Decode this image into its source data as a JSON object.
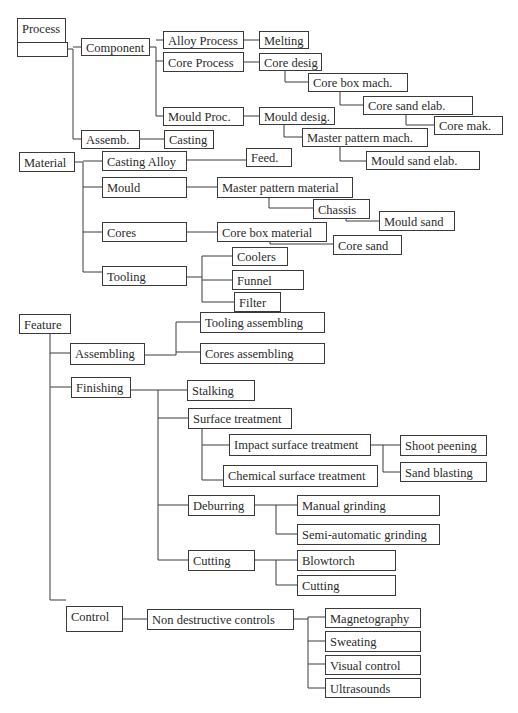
{
  "colors": {
    "line": "#3a3a3a",
    "text": "#2a2a2a",
    "background": "#ffffff"
  },
  "nodes": [
    {
      "id": "process",
      "label": "Process",
      "x": 17,
      "y": 18,
      "w": 48,
      "h": 24
    },
    {
      "id": "process_under",
      "label": "",
      "x": 17,
      "y": 42,
      "w": 50,
      "h": 14
    },
    {
      "id": "component",
      "label": "Component",
      "x": 81,
      "y": 38,
      "w": 68,
      "h": 17
    },
    {
      "id": "alloy_process",
      "label": "Alloy Process",
      "x": 163,
      "y": 31,
      "w": 80,
      "h": 17
    },
    {
      "id": "melting",
      "label": "Melting",
      "x": 259,
      "y": 31,
      "w": 49,
      "h": 17
    },
    {
      "id": "core_process",
      "label": "Core Process",
      "x": 163,
      "y": 52,
      "w": 80,
      "h": 19
    },
    {
      "id": "core_desig",
      "label": "Core desig",
      "x": 259,
      "y": 53,
      "w": 62,
      "h": 17
    },
    {
      "id": "core_box_mach",
      "label": "Core box mach.",
      "x": 308,
      "y": 73,
      "w": 99,
      "h": 18
    },
    {
      "id": "core_sand_elab",
      "label": "Core sand elab.",
      "x": 363,
      "y": 96,
      "w": 109,
      "h": 18
    },
    {
      "id": "core_mak",
      "label": "Core mak.",
      "x": 434,
      "y": 116,
      "w": 68,
      "h": 18
    },
    {
      "id": "mould_proc",
      "label": "Mould Proc.",
      "x": 163,
      "y": 107,
      "w": 80,
      "h": 18
    },
    {
      "id": "mould_desig",
      "label": "Mould desig.",
      "x": 259,
      "y": 107,
      "w": 75,
      "h": 17
    },
    {
      "id": "master_pattern_mach",
      "label": "Master pattern mach.",
      "x": 302,
      "y": 128,
      "w": 125,
      "h": 18
    },
    {
      "id": "mould_sand_elab",
      "label": "Mould sand elab.",
      "x": 366,
      "y": 151,
      "w": 113,
      "h": 18
    },
    {
      "id": "assemb",
      "label": "Assemb.",
      "x": 81,
      "y": 130,
      "w": 58,
      "h": 18
    },
    {
      "id": "casting",
      "label": "Casting",
      "x": 164,
      "y": 130,
      "w": 49,
      "h": 18
    },
    {
      "id": "material",
      "label": "Material",
      "x": 19,
      "y": 152,
      "w": 55,
      "h": 19
    },
    {
      "id": "casting_alloy",
      "label": "Casting Alloy",
      "x": 102,
      "y": 151,
      "w": 84,
      "h": 19
    },
    {
      "id": "feed",
      "label": "Feed.",
      "x": 246,
      "y": 148,
      "w": 45,
      "h": 18
    },
    {
      "id": "mould",
      "label": "Mould",
      "x": 102,
      "y": 177,
      "w": 84,
      "h": 20
    },
    {
      "id": "master_pattern_material",
      "label": "Master pattern material",
      "x": 217,
      "y": 177,
      "w": 135,
      "h": 20
    },
    {
      "id": "chassis",
      "label": "Chassis",
      "x": 313,
      "y": 199,
      "w": 56,
      "h": 19
    },
    {
      "id": "mould_sand",
      "label": "Mould sand",
      "x": 379,
      "y": 211,
      "w": 75,
      "h": 19
    },
    {
      "id": "cores",
      "label": "Cores",
      "x": 102,
      "y": 222,
      "w": 84,
      "h": 19
    },
    {
      "id": "core_box_material",
      "label": "Core box material",
      "x": 217,
      "y": 222,
      "w": 109,
      "h": 19
    },
    {
      "id": "core_sand",
      "label": "Core sand",
      "x": 333,
      "y": 235,
      "w": 68,
      "h": 19
    },
    {
      "id": "tooling",
      "label": "Tooling",
      "x": 102,
      "y": 266,
      "w": 84,
      "h": 19
    },
    {
      "id": "coolers",
      "label": "Coolers",
      "x": 232,
      "y": 247,
      "w": 55,
      "h": 18
    },
    {
      "id": "funnel",
      "label": "Funnel",
      "x": 232,
      "y": 270,
      "w": 71,
      "h": 19
    },
    {
      "id": "filter",
      "label": "Filter",
      "x": 234,
      "y": 292,
      "w": 46,
      "h": 19
    },
    {
      "id": "feature",
      "label": "Feature",
      "x": 19,
      "y": 314,
      "w": 51,
      "h": 19
    },
    {
      "id": "tooling_assembling",
      "label": "Tooling assembling",
      "x": 200,
      "y": 312,
      "w": 124,
      "h": 20
    },
    {
      "id": "assembling",
      "label": "Assembling",
      "x": 70,
      "y": 343,
      "w": 74,
      "h": 21
    },
    {
      "id": "cores_assembling",
      "label": "Cores assembling",
      "x": 200,
      "y": 343,
      "w": 124,
      "h": 20
    },
    {
      "id": "finishing",
      "label": "Finishing",
      "x": 71,
      "y": 377,
      "w": 59,
      "h": 20
    },
    {
      "id": "stalking",
      "label": "Stalking",
      "x": 187,
      "y": 380,
      "w": 67,
      "h": 20
    },
    {
      "id": "surface_treatment",
      "label": "Surface treatment",
      "x": 188,
      "y": 408,
      "w": 103,
      "h": 20
    },
    {
      "id": "impact_surface_treatment",
      "label": "Impact surface treatment",
      "x": 229,
      "y": 434,
      "w": 141,
      "h": 21
    },
    {
      "id": "shoot_peening",
      "label": "Shoot peening",
      "x": 400,
      "y": 435,
      "w": 86,
      "h": 20
    },
    {
      "id": "chemical_surface_treatment",
      "label": "Chemical surface treatment",
      "x": 223,
      "y": 465,
      "w": 154,
      "h": 21
    },
    {
      "id": "sand_blasting",
      "label": "Sand blasting",
      "x": 400,
      "y": 462,
      "w": 86,
      "h": 19
    },
    {
      "id": "deburring",
      "label": "Deburring",
      "x": 188,
      "y": 495,
      "w": 66,
      "h": 20
    },
    {
      "id": "manual_grinding",
      "label": "Manual grinding",
      "x": 297,
      "y": 495,
      "w": 142,
      "h": 20
    },
    {
      "id": "semi_automatic_grinding",
      "label": "Semi-automatic grinding",
      "x": 297,
      "y": 524,
      "w": 142,
      "h": 20
    },
    {
      "id": "cutting_parent",
      "label": "Cutting",
      "x": 188,
      "y": 550,
      "w": 66,
      "h": 20
    },
    {
      "id": "blowtorch",
      "label": "Blowtorch",
      "x": 297,
      "y": 550,
      "w": 98,
      "h": 20
    },
    {
      "id": "cutting_child",
      "label": "Cutting",
      "x": 297,
      "y": 575,
      "w": 98,
      "h": 20
    },
    {
      "id": "control",
      "label": "Control",
      "x": 66,
      "y": 606,
      "w": 56,
      "h": 25
    },
    {
      "id": "non_destructive_controls",
      "label": "Non destructive controls",
      "x": 147,
      "y": 609,
      "w": 146,
      "h": 20
    },
    {
      "id": "magnetography",
      "label": "Magnetography",
      "x": 325,
      "y": 608,
      "w": 95,
      "h": 19
    },
    {
      "id": "sweating",
      "label": "Sweating",
      "x": 325,
      "y": 631,
      "w": 95,
      "h": 20
    },
    {
      "id": "visual_control",
      "label": "Visual control",
      "x": 325,
      "y": 655,
      "w": 95,
      "h": 19
    },
    {
      "id": "ultrasounds",
      "label": "Ultrasounds",
      "x": 325,
      "y": 678,
      "w": 95,
      "h": 19
    }
  ],
  "edges": [
    "M67,49 H73 V139 H81",
    "M73,47 H81",
    "M149,47 H156 V116 H163",
    "M156,40 H163",
    "M156,61 H163",
    "M243,40 H259",
    "M243,62 H259",
    "M243,116 H259",
    "M285,70 V82 H308",
    "M340,91 V105 H363",
    "M406,114 V125 H434",
    "M284,124 V137 H302",
    "M340,146 V161 H366",
    "M139,139 H164",
    "M74,162 H83 V272 H102",
    "M83,161 H102",
    "M83,187 H102",
    "M83,232 H102",
    "M186,160 H246",
    "M186,187 H217",
    "M186,232 H217",
    "M269,197 V208 H313",
    "M346,218 V221 H379",
    "M270,241 V244 H333",
    "M186,277 H202",
    "M202,256 V302 H234",
    "M202,256 H232",
    "M202,280 H232",
    "M50,333 V600 H66",
    "M50,353 H70",
    "M50,387 H71",
    "M144,355 H176",
    "M176,322 V355",
    "M176,322 H200",
    "M176,352 H200",
    "M130,390 H158 V560 H188",
    "M158,390 H187",
    "M158,418 H188",
    "M158,505 H188",
    "M202,428 V480 H223",
    "M202,445 H229",
    "M370,445 H383",
    "M383,445 V472 H400",
    "M383,445 H400",
    "M254,505 H297",
    "M276,505 V534 H297",
    "M254,560 H276",
    "M276,560 V585 H297",
    "M276,560 H297",
    "M122,619 H147",
    "M293,619 H308",
    "M308,617 V688 H325",
    "M308,617 H325",
    "M308,641 H325",
    "M308,664 H325"
  ]
}
